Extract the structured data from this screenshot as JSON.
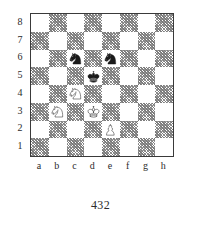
{
  "diagram": {
    "caption": "432",
    "rank_labels": [
      "8",
      "7",
      "6",
      "5",
      "4",
      "3",
      "2",
      "1"
    ],
    "file_labels": [
      "a",
      "b",
      "c",
      "d",
      "e",
      "f",
      "g",
      "h"
    ],
    "colors": {
      "light_square": "#ffffff",
      "dark_square": "#9a9a9a",
      "border": "#3a3a3a",
      "white_piece_fill": "#ffffff",
      "white_piece_stroke": "#1a1a1a",
      "black_piece_fill": "#1a1a1a",
      "black_piece_stroke": "#1a1a1a",
      "text": "#2b2b2b"
    },
    "board": {
      "rows": [
        [
          {
            "square": "a8",
            "shade": "light",
            "piece": null
          },
          {
            "square": "b8",
            "shade": "dark",
            "piece": null
          },
          {
            "square": "c8",
            "shade": "light",
            "piece": null
          },
          {
            "square": "d8",
            "shade": "dark",
            "piece": null
          },
          {
            "square": "e8",
            "shade": "light",
            "piece": null
          },
          {
            "square": "f8",
            "shade": "dark",
            "piece": null
          },
          {
            "square": "g8",
            "shade": "light",
            "piece": null
          },
          {
            "square": "h8",
            "shade": "dark",
            "piece": null
          }
        ],
        [
          {
            "square": "a7",
            "shade": "dark",
            "piece": null
          },
          {
            "square": "b7",
            "shade": "light",
            "piece": null
          },
          {
            "square": "c7",
            "shade": "dark",
            "piece": null
          },
          {
            "square": "d7",
            "shade": "light",
            "piece": null
          },
          {
            "square": "e7",
            "shade": "dark",
            "piece": null
          },
          {
            "square": "f7",
            "shade": "light",
            "piece": null
          },
          {
            "square": "g7",
            "shade": "dark",
            "piece": null
          },
          {
            "square": "h7",
            "shade": "light",
            "piece": null
          }
        ],
        [
          {
            "square": "a6",
            "shade": "light",
            "piece": null
          },
          {
            "square": "b6",
            "shade": "dark",
            "piece": null
          },
          {
            "square": "c6",
            "shade": "light",
            "piece": "black-knight"
          },
          {
            "square": "d6",
            "shade": "dark",
            "piece": null
          },
          {
            "square": "e6",
            "shade": "light",
            "piece": "black-knight"
          },
          {
            "square": "f6",
            "shade": "dark",
            "piece": null
          },
          {
            "square": "g6",
            "shade": "light",
            "piece": null
          },
          {
            "square": "h6",
            "shade": "dark",
            "piece": null
          }
        ],
        [
          {
            "square": "a5",
            "shade": "dark",
            "piece": null
          },
          {
            "square": "b5",
            "shade": "light",
            "piece": null
          },
          {
            "square": "c5",
            "shade": "dark",
            "piece": null
          },
          {
            "square": "d5",
            "shade": "light",
            "piece": "black-king"
          },
          {
            "square": "e5",
            "shade": "dark",
            "piece": null
          },
          {
            "square": "f5",
            "shade": "light",
            "piece": null
          },
          {
            "square": "g5",
            "shade": "dark",
            "piece": null
          },
          {
            "square": "h5",
            "shade": "light",
            "piece": null
          }
        ],
        [
          {
            "square": "a4",
            "shade": "light",
            "piece": null
          },
          {
            "square": "b4",
            "shade": "dark",
            "piece": null
          },
          {
            "square": "c4",
            "shade": "light",
            "piece": "white-knight"
          },
          {
            "square": "d4",
            "shade": "dark",
            "piece": null
          },
          {
            "square": "e4",
            "shade": "light",
            "piece": null
          },
          {
            "square": "f4",
            "shade": "dark",
            "piece": null
          },
          {
            "square": "g4",
            "shade": "light",
            "piece": null
          },
          {
            "square": "h4",
            "shade": "dark",
            "piece": null
          }
        ],
        [
          {
            "square": "a3",
            "shade": "dark",
            "piece": null
          },
          {
            "square": "b3",
            "shade": "light",
            "piece": "white-knight"
          },
          {
            "square": "c3",
            "shade": "dark",
            "piece": null
          },
          {
            "square": "d3",
            "shade": "light",
            "piece": "white-king"
          },
          {
            "square": "e3",
            "shade": "dark",
            "piece": null
          },
          {
            "square": "f3",
            "shade": "light",
            "piece": null
          },
          {
            "square": "g3",
            "shade": "dark",
            "piece": null
          },
          {
            "square": "h3",
            "shade": "light",
            "piece": null
          }
        ],
        [
          {
            "square": "a2",
            "shade": "light",
            "piece": null
          },
          {
            "square": "b2",
            "shade": "dark",
            "piece": null
          },
          {
            "square": "c2",
            "shade": "light",
            "piece": null
          },
          {
            "square": "d2",
            "shade": "dark",
            "piece": null
          },
          {
            "square": "e2",
            "shade": "light",
            "piece": "white-pawn"
          },
          {
            "square": "f2",
            "shade": "dark",
            "piece": null
          },
          {
            "square": "g2",
            "shade": "light",
            "piece": null
          },
          {
            "square": "h2",
            "shade": "dark",
            "piece": null
          }
        ],
        [
          {
            "square": "a1",
            "shade": "dark",
            "piece": null
          },
          {
            "square": "b1",
            "shade": "light",
            "piece": null
          },
          {
            "square": "c1",
            "shade": "dark",
            "piece": null
          },
          {
            "square": "d1",
            "shade": "light",
            "piece": null
          },
          {
            "square": "e1",
            "shade": "dark",
            "piece": null
          },
          {
            "square": "f1",
            "shade": "light",
            "piece": null
          },
          {
            "square": "g1",
            "shade": "dark",
            "piece": null
          },
          {
            "square": "h1",
            "shade": "light",
            "piece": null
          }
        ]
      ]
    },
    "position": {
      "white": [
        "Nc4",
        "Nb3",
        "Kd3",
        "Pe2"
      ],
      "black": [
        "Nc6",
        "Ne6",
        "Kd5"
      ]
    }
  }
}
